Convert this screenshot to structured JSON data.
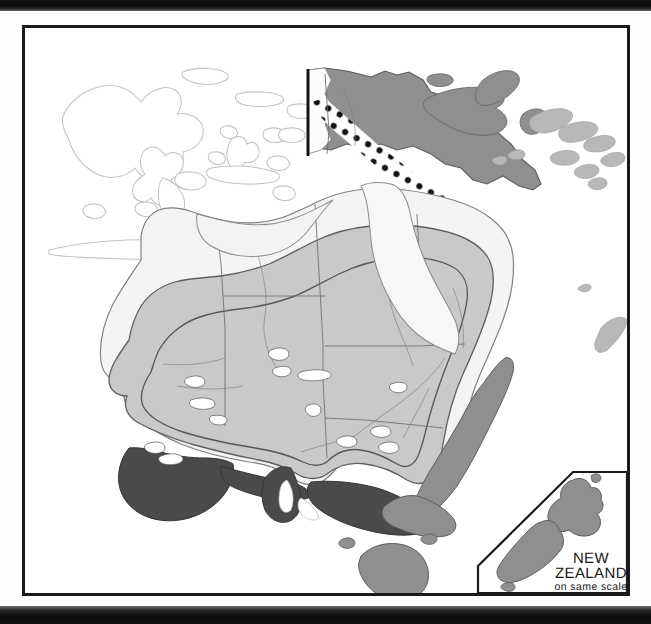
{
  "page": {
    "kind": "scanned-distribution-map",
    "background_color": "#ffffff",
    "frame_color": "#1a1a1a"
  },
  "scan_artifacts": {
    "top_bar_label": "page-edge-shadow-top",
    "bottom_bar_label": "page-edge-shadow-bottom",
    "color": "#0d0d0d"
  },
  "map": {
    "title": "",
    "regions_shown": [
      "Indonesia",
      "New Guinea",
      "Solomon Islands",
      "New Caledonia",
      "Australia",
      "Tasmania",
      "New Zealand"
    ],
    "palette": {
      "range_light": "#c9c9c9",
      "range_mid": "#8f8f8f",
      "range_dark": "#4a4a4a",
      "land_unshaded": "#f2f2f2",
      "outline_faint": "#b9b9b9",
      "outline": "#6d6d6d",
      "border_line": "#5a5a5a",
      "contour_line": "#555555",
      "dot_fill": "#121212",
      "dot_band": "#ffffff"
    },
    "features": {
      "dotted_highland_band": "new-guinea-central-highlands-dots",
      "dot_count": 34,
      "contour_bands": 2
    }
  },
  "inset": {
    "name": "new-zealand-inset",
    "line1": "NEW",
    "line2": "ZEALAND",
    "line3": "on same scale",
    "border_color": "#1a1a1a",
    "chamfered_corner": true
  }
}
